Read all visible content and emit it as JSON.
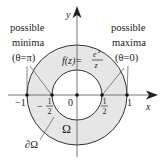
{
  "diagram": {
    "type": "complex-plane-annulus",
    "colors": {
      "annulus_fill": "#e6e6e6",
      "stroke": "#333333",
      "text": "#222222"
    },
    "geometry": {
      "origin_px": [
        77,
        95
      ],
      "outer_radius_px": 50,
      "inner_radius_px": 25
    },
    "axes": {
      "x_label": "x",
      "y_label": "y"
    },
    "ticks": {
      "minus_one": "−1",
      "minus_half_sign": "−",
      "minus_half_num": "1",
      "minus_half_den": "2",
      "zero": "0",
      "plus_half_num": "1",
      "plus_half_den": "2",
      "plus_one": "1"
    },
    "function_label": {
      "prefix": "f(z)=",
      "numerator_base": "e",
      "numerator_exp": "z",
      "denominator": "z"
    },
    "region_label": "Ω",
    "boundary_label": "∂Ω",
    "annotations": {
      "left": {
        "line1": "possible",
        "line2": "minima",
        "line3": "(θ=π)"
      },
      "right": {
        "line1": "possible",
        "line2": "maxima",
        "line3": "(θ=0)"
      }
    }
  }
}
